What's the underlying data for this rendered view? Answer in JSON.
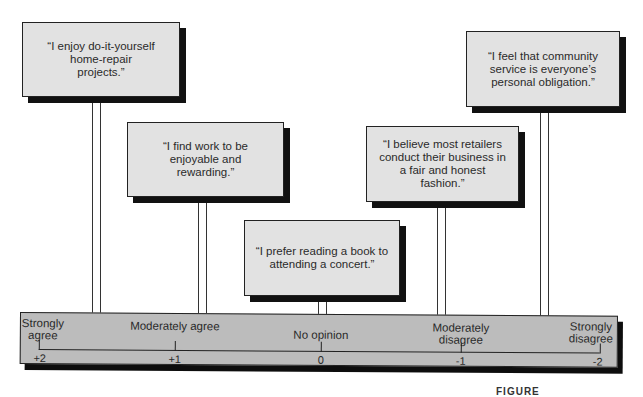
{
  "cards": [
    {
      "text": "“I enjoy do-it-yourself home-repair projects.”"
    },
    {
      "text": "“I find work to be enjoyable and rewarding.”"
    },
    {
      "text": "“I prefer reading a book to attending a concert.”"
    },
    {
      "text": "“I believe most retailers conduct their business in a fair and honest fashion.”"
    },
    {
      "text": "“I feel that community service is everyone’s personal obligation.”"
    }
  ],
  "scale": {
    "points": [
      {
        "label": "Strongly agree",
        "value": "+2"
      },
      {
        "label": "Moderately agree",
        "value": "+1"
      },
      {
        "label": "No opinion",
        "value": "0"
      },
      {
        "label": "Moderately disagree",
        "value": "-1"
      },
      {
        "label": "Strongly disagree",
        "value": "-2"
      }
    ]
  },
  "caption": "FIGURE",
  "colors": {
    "card_fill": "#e2e2e2",
    "scale_fill": "#bcbcbc",
    "shadow": "#111111"
  }
}
